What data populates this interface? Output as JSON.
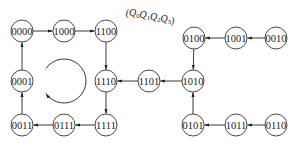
{
  "diagram": {
    "title_parts": [
      {
        "text": "(Q",
        "sub": "0"
      },
      {
        "text": "Q",
        "sub": "1"
      },
      {
        "text": "Q",
        "sub": "2"
      },
      {
        "text": "Q",
        "sub": "3"
      },
      {
        "text": ")",
        "sub": ""
      }
    ],
    "nodes": [
      {
        "id": "0000",
        "label": "0000",
        "x": 22,
        "y": 31
      },
      {
        "id": "1000",
        "label": "1000",
        "x": 64,
        "y": 31
      },
      {
        "id": "1100",
        "label": "1100",
        "x": 106,
        "y": 31
      },
      {
        "id": "0100",
        "label": "0100",
        "x": 194,
        "y": 38
      },
      {
        "id": "1001",
        "label": "1001",
        "x": 236,
        "y": 38
      },
      {
        "id": "0010",
        "label": "0010",
        "x": 276,
        "y": 38
      },
      {
        "id": "0001",
        "label": "0001",
        "x": 22,
        "y": 81
      },
      {
        "id": "1110",
        "label": "1110",
        "x": 106,
        "y": 81
      },
      {
        "id": "1101",
        "label": "1101",
        "x": 149,
        "y": 81
      },
      {
        "id": "1010",
        "label": "1010",
        "x": 193,
        "y": 81
      },
      {
        "id": "0011",
        "label": "0011",
        "x": 22,
        "y": 125
      },
      {
        "id": "0111",
        "label": "0111",
        "x": 64,
        "y": 125
      },
      {
        "id": "1111",
        "label": "1111",
        "x": 106,
        "y": 125
      },
      {
        "id": "0101",
        "label": "0101",
        "x": 193,
        "y": 125
      },
      {
        "id": "1011",
        "label": "1011",
        "x": 236,
        "y": 125
      },
      {
        "id": "0110",
        "label": "0110",
        "x": 276,
        "y": 125
      }
    ],
    "edges": [
      {
        "from": "0000",
        "to": "1000"
      },
      {
        "from": "1000",
        "to": "1100"
      },
      {
        "from": "1100",
        "to": "1110"
      },
      {
        "from": "1110",
        "to": "1111"
      },
      {
        "from": "1111",
        "to": "0111"
      },
      {
        "from": "0111",
        "to": "0011"
      },
      {
        "from": "0011",
        "to": "0001"
      },
      {
        "from": "0001",
        "to": "0000"
      },
      {
        "from": "1001",
        "to": "0100"
      },
      {
        "from": "0010",
        "to": "1001"
      },
      {
        "from": "0100",
        "to": "1010"
      },
      {
        "from": "1010",
        "to": "1101"
      },
      {
        "from": "1101",
        "to": "1110"
      },
      {
        "from": "0101",
        "to": "1010"
      },
      {
        "from": "1011",
        "to": "0101"
      },
      {
        "from": "0110",
        "to": "1011"
      }
    ],
    "cycle_indicator": {
      "cx": 64,
      "cy": 81,
      "r": 22,
      "direction": "counterclockwise"
    },
    "node_radius": 11
  }
}
